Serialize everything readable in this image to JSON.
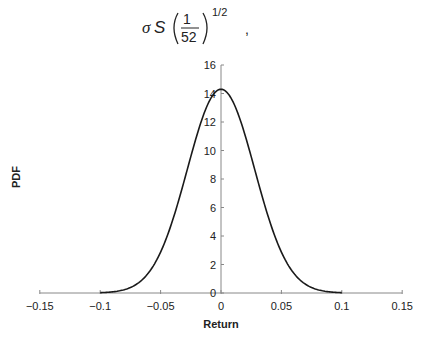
{
  "formula": {
    "sigma": "σ",
    "S": "S",
    "numerator": "1",
    "denominator": "52",
    "exponent": "1/2",
    "trailing": ","
  },
  "chart_data": {
    "type": "line",
    "title": "",
    "xlabel": "Return",
    "ylabel": "PDF",
    "xlim": [
      -0.15,
      0.15
    ],
    "ylim": [
      0,
      16
    ],
    "x_ticks": [
      "-0.15",
      "-0.1",
      "-0.05",
      "0",
      "0.05",
      "0.1",
      "0.15"
    ],
    "x_tick_values": [
      -0.15,
      -0.1,
      -0.05,
      0,
      0.05,
      0.1,
      0.15
    ],
    "y_ticks": [
      "0",
      "2",
      "4",
      "6",
      "8",
      "10",
      "12",
      "14",
      "16"
    ],
    "y_tick_values": [
      0,
      2,
      4,
      6,
      8,
      10,
      12,
      14,
      16
    ],
    "grid": false,
    "legend": null,
    "series": [
      {
        "name": "Normal PDF",
        "distribution": "normal",
        "mean": 0,
        "std": 0.0279,
        "x_range": [
          -0.1,
          0.1
        ],
        "peak": 14.3,
        "x": [
          -0.1,
          -0.09,
          -0.08,
          -0.07,
          -0.06,
          -0.05,
          -0.04,
          -0.03,
          -0.02,
          -0.01,
          0,
          0.01,
          0.02,
          0.03,
          0.04,
          0.05,
          0.06,
          0.07,
          0.08,
          0.09,
          0.1
        ],
        "y": [
          0.02,
          0.08,
          0.24,
          0.62,
          1.42,
          2.87,
          5.09,
          7.99,
          10.99,
          13.41,
          14.3,
          13.41,
          10.99,
          7.99,
          5.09,
          2.87,
          1.42,
          0.62,
          0.24,
          0.08,
          0.02
        ]
      }
    ]
  }
}
